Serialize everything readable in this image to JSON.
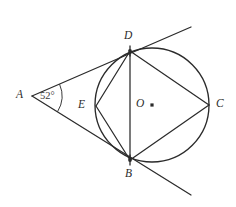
{
  "figure": {
    "type": "geometry-diagram",
    "canvas": {
      "width": 236,
      "height": 207
    },
    "background_color": "#ffffff",
    "ink_color": "#2b2b2b"
  },
  "circle": {
    "center": {
      "x": 152,
      "y": 105
    },
    "radius": 57,
    "center_label": "O",
    "center_label_pos": {
      "x": 136,
      "y": 98
    },
    "center_dot_pos": {
      "x": 152,
      "y": 105
    }
  },
  "points": [
    {
      "id": "A",
      "label": "A",
      "x": 32,
      "y": 96,
      "label_x": 16,
      "label_y": 89,
      "role": "external-vertex"
    },
    {
      "id": "D",
      "label": "D",
      "x": 130,
      "y": 51,
      "label_x": 124,
      "label_y": 30,
      "role": "tangent-point"
    },
    {
      "id": "B",
      "label": "B",
      "x": 130,
      "y": 160,
      "label_x": 125,
      "label_y": 168,
      "role": "tangent-point"
    },
    {
      "id": "C",
      "label": "C",
      "x": 209,
      "y": 105,
      "label_x": 216,
      "label_y": 98,
      "role": "circle-point"
    },
    {
      "id": "E",
      "label": "E",
      "x": 96,
      "y": 106,
      "label_x": 78,
      "label_y": 99,
      "role": "circle-point"
    }
  ],
  "segments": [
    {
      "id": "AD",
      "from": "A",
      "to": "D",
      "kind": "tangent"
    },
    {
      "id": "AB",
      "from": "A",
      "to": "B",
      "kind": "tangent"
    },
    {
      "id": "DE",
      "from": "D",
      "to": "E",
      "kind": "chord"
    },
    {
      "id": "EB",
      "from": "E",
      "to": "B",
      "kind": "chord"
    },
    {
      "id": "DC",
      "from": "D",
      "to": "C",
      "kind": "chord"
    },
    {
      "id": "CB",
      "from": "C",
      "to": "B",
      "kind": "chord"
    },
    {
      "id": "DB",
      "from": "D",
      "to": "B",
      "kind": "chord"
    }
  ],
  "tangent_rays": [
    {
      "id": "ray-upper",
      "through": "D",
      "end_x": 191,
      "end_y": 27
    },
    {
      "id": "ray-lower",
      "through": "B",
      "end_x": 191,
      "end_y": 195
    }
  ],
  "angle": {
    "at": "A",
    "value": "52",
    "unit": "°",
    "text": "52°",
    "label_x": 40,
    "label_y": 91,
    "arc_radius": 30
  },
  "tick_marks": [
    {
      "at": "D",
      "count": 1,
      "orientation": "vertical"
    },
    {
      "at": "B",
      "count": 1,
      "orientation": "vertical"
    }
  ]
}
